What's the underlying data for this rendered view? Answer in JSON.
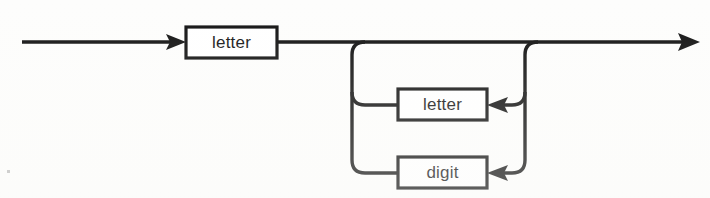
{
  "diagram": {
    "kind": "railroad-syntax-diagram",
    "name": "identifier",
    "colors": {
      "background": "#fdfdfc",
      "line": "#111111",
      "box_fill": "#ffffff",
      "box_stroke": "#111111",
      "text": "#141414",
      "speck": "#bdbdbd"
    },
    "entry": {
      "arrow_name": "entry-arrow",
      "start_x": 22,
      "end_x": 186,
      "y": 42
    },
    "exit": {
      "arrow_name": "exit-arrow",
      "start_x": 277,
      "end_x": 700,
      "y": 42
    },
    "nodes": [
      {
        "id": "letter-first",
        "label": "letter",
        "x": 186,
        "y": 27,
        "width": 91,
        "height": 31,
        "role": "first-character"
      },
      {
        "id": "letter-repeat",
        "label": "letter",
        "x": 398,
        "y": 89,
        "width": 89,
        "height": 31,
        "role": "repeat-alternative"
      },
      {
        "id": "digit-repeat",
        "label": "digit",
        "x": 398,
        "y": 157,
        "width": 89,
        "height": 31,
        "role": "repeat-alternative"
      }
    ],
    "loop": {
      "left_rail_x": 352,
      "right_rail_x": 525,
      "top_y": 42,
      "branch_letter_y": 105,
      "branch_digit_y": 173,
      "corner_radius": 13
    },
    "arrow_markers": [
      {
        "name": "entry-arrow-head",
        "x": 186,
        "y": 42,
        "direction": "right"
      },
      {
        "name": "exit-arrow-head",
        "x": 700,
        "y": 42,
        "direction": "right"
      },
      {
        "name": "letter-loop-arrow-head",
        "x": 487,
        "y": 105,
        "direction": "left"
      },
      {
        "name": "digit-loop-arrow-head",
        "x": 487,
        "y": 173,
        "direction": "left"
      }
    ],
    "artifact": {
      "name": "scan-speck",
      "x": 7,
      "y": 170,
      "size": 3
    }
  }
}
